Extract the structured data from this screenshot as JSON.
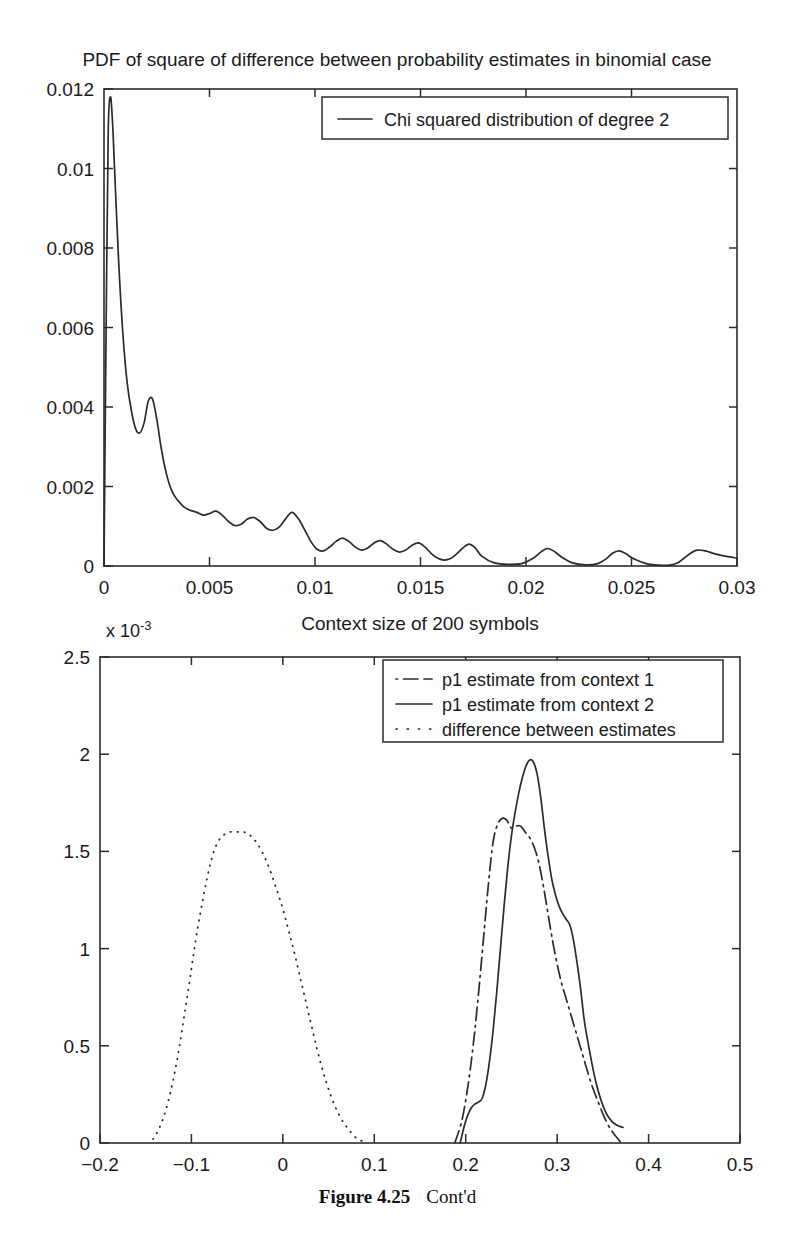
{
  "figure": {
    "caption_label": "Figure  4.25",
    "caption_text": "Cont'd"
  },
  "chart_data": [
    {
      "id": "top",
      "type": "line",
      "title": "PDF of square of difference between probability estimates in binomial case",
      "xlabel": "",
      "ylabel": "",
      "xlim": [
        0,
        0.03
      ],
      "ylim": [
        0,
        0.012
      ],
      "xticks": [
        0,
        0.005,
        0.01,
        0.015,
        0.02,
        0.025,
        0.03
      ],
      "xticklabels": [
        "0",
        "0.005",
        "0.01",
        "0.015",
        "0.02",
        "0.025",
        "0.03"
      ],
      "yticks": [
        0,
        0.002,
        0.004,
        0.006,
        0.008,
        0.01,
        0.012
      ],
      "yticklabels": [
        "0",
        "0.002",
        "0.004",
        "0.006",
        "0.008",
        "0.01",
        "0.012"
      ],
      "grid": false,
      "legend_position": "top-center",
      "legend": [
        "Chi squared distribution of degree 2"
      ],
      "series": [
        {
          "name": "Chi squared distribution of degree 2",
          "style": "solid",
          "x": [
            0.0,
            0.0001,
            0.0002,
            0.0003,
            0.0004,
            0.0005,
            0.0007,
            0.0009,
            0.0011,
            0.0013,
            0.0015,
            0.0017,
            0.0019,
            0.0021,
            0.0023,
            0.0025,
            0.0027,
            0.0029,
            0.0031,
            0.0033,
            0.0035,
            0.0038,
            0.0041,
            0.0044,
            0.0047,
            0.005,
            0.0053,
            0.0056,
            0.0059,
            0.0062,
            0.0065,
            0.0068,
            0.0071,
            0.0074,
            0.0077,
            0.008,
            0.0083,
            0.0086,
            0.0089,
            0.0092,
            0.0095,
            0.0098,
            0.0101,
            0.0104,
            0.0107,
            0.011,
            0.0113,
            0.0116,
            0.0119,
            0.0122,
            0.0125,
            0.0128,
            0.0131,
            0.0134,
            0.0137,
            0.014,
            0.0143,
            0.0146,
            0.0149,
            0.0152,
            0.0155,
            0.0158,
            0.0161,
            0.0164,
            0.0167,
            0.017,
            0.0173,
            0.0176,
            0.0179,
            0.0185,
            0.0192,
            0.0198,
            0.0203,
            0.0207,
            0.021,
            0.0213,
            0.0217,
            0.0222,
            0.0228,
            0.0234,
            0.0238,
            0.0241,
            0.0244,
            0.0247,
            0.0251,
            0.0257,
            0.0263,
            0.0268,
            0.0272,
            0.0275,
            0.0278,
            0.0281,
            0.0285,
            0.029,
            0.0295,
            0.03
          ],
          "y": [
            0.0,
            0.006,
            0.0109,
            0.0118,
            0.0112,
            0.01,
            0.0076,
            0.0058,
            0.0046,
            0.0039,
            0.00345,
            0.00335,
            0.0036,
            0.00415,
            0.0042,
            0.0037,
            0.003,
            0.00245,
            0.00205,
            0.0018,
            0.00165,
            0.00148,
            0.0014,
            0.00135,
            0.00128,
            0.00132,
            0.00138,
            0.00128,
            0.00112,
            0.00102,
            0.00105,
            0.00118,
            0.00122,
            0.00112,
            0.00095,
            0.0009,
            0.00098,
            0.00118,
            0.00135,
            0.0012,
            0.00092,
            0.00062,
            0.00042,
            0.00038,
            0.00048,
            0.00062,
            0.0007,
            0.00062,
            0.00048,
            0.0004,
            0.00045,
            0.00058,
            0.00064,
            0.00055,
            0.00042,
            0.00035,
            0.0004,
            0.00052,
            0.00058,
            0.00048,
            0.00032,
            0.0002,
            0.00015,
            0.00018,
            0.0003,
            0.00045,
            0.00055,
            0.00045,
            0.00025,
            8e-05,
            4e-05,
            6e-05,
            0.00018,
            0.00035,
            0.00044,
            0.00038,
            0.00022,
            8e-05,
            3e-05,
            6e-05,
            0.00018,
            0.00032,
            0.00038,
            0.00032,
            0.00018,
            6e-05,
            2e-05,
            2e-05,
            8e-05,
            0.0002,
            0.00032,
            0.0004,
            0.00038,
            0.0003,
            0.00024,
            0.0002
          ]
        }
      ]
    },
    {
      "id": "bottom",
      "type": "line",
      "title": "Context size of 200 symbols",
      "y_multiplier_base": "x 10",
      "y_multiplier_exp": "-3",
      "xlabel": "",
      "ylabel": "",
      "xlim": [
        -0.2,
        0.5
      ],
      "ylim": [
        0,
        0.0025
      ],
      "xticks": [
        -0.2,
        -0.1,
        0,
        0.1,
        0.2,
        0.3,
        0.4,
        0.5
      ],
      "xticklabels": [
        "-0.2",
        "-0.1",
        "0",
        "0.1",
        "0.2",
        "0.3",
        "0.4",
        "0.5"
      ],
      "yticks": [
        0,
        0.0005,
        0.001,
        0.0015,
        0.002,
        0.0025
      ],
      "yticklabels": [
        "0",
        "0.5",
        "1",
        "1.5",
        "2",
        "2.5"
      ],
      "grid": false,
      "legend_position": "top-center",
      "legend": [
        "p1 estimate from context 1",
        "p1 estimate from context 2",
        "difference between estimates"
      ],
      "series": [
        {
          "name": "p1 estimate from context 1",
          "style": "dashdot",
          "x": [
            0.188,
            0.195,
            0.2,
            0.205,
            0.21,
            0.215,
            0.22,
            0.225,
            0.23,
            0.235,
            0.24,
            0.245,
            0.25,
            0.255,
            0.26,
            0.265,
            0.27,
            0.275,
            0.28,
            0.285,
            0.29,
            0.295,
            0.3,
            0.305,
            0.31,
            0.315,
            0.32,
            0.325,
            0.33,
            0.335,
            0.34,
            0.345,
            0.35,
            0.355,
            0.36,
            0.365,
            0.37
          ],
          "y": [
            0.0,
            0.0001,
            0.00022,
            0.00038,
            0.00058,
            0.00082,
            0.00108,
            0.00134,
            0.00155,
            0.00164,
            0.00167,
            0.00166,
            0.00162,
            0.00163,
            0.00163,
            0.0016,
            0.00157,
            0.00152,
            0.00144,
            0.00132,
            0.00118,
            0.00104,
            0.00092,
            0.00082,
            0.00074,
            0.00066,
            0.00058,
            0.0005,
            0.00042,
            0.00034,
            0.00027,
            0.00021,
            0.00015,
            0.0001,
            6e-05,
            3e-05,
            0.0
          ]
        },
        {
          "name": "p1 estimate from context 2",
          "style": "solid",
          "x": [
            0.194,
            0.198,
            0.202,
            0.206,
            0.21,
            0.214,
            0.218,
            0.222,
            0.226,
            0.23,
            0.234,
            0.238,
            0.242,
            0.246,
            0.25,
            0.254,
            0.258,
            0.262,
            0.266,
            0.27,
            0.274,
            0.278,
            0.282,
            0.286,
            0.29,
            0.294,
            0.298,
            0.302,
            0.306,
            0.31,
            0.314,
            0.318,
            0.322,
            0.326,
            0.33,
            0.336,
            0.342,
            0.348,
            0.354,
            0.36,
            0.366,
            0.372
          ],
          "y": [
            0.0,
            8e-05,
            0.00014,
            0.00018,
            0.0002,
            0.00021,
            0.00023,
            0.0003,
            0.00042,
            0.00058,
            0.00078,
            0.001,
            0.00122,
            0.00142,
            0.00158,
            0.0017,
            0.0018,
            0.00188,
            0.00194,
            0.00197,
            0.00196,
            0.0019,
            0.00178,
            0.00162,
            0.00148,
            0.00136,
            0.00128,
            0.00122,
            0.00118,
            0.00115,
            0.00112,
            0.00104,
            0.00092,
            0.00078,
            0.00062,
            0.00046,
            0.00032,
            0.00022,
            0.00015,
            0.00011,
            9e-05,
            8e-05
          ]
        },
        {
          "name": "difference between estimates",
          "style": "dotted",
          "x": [
            -0.142,
            -0.138,
            -0.133,
            -0.128,
            -0.123,
            -0.118,
            -0.113,
            -0.108,
            -0.103,
            -0.098,
            -0.093,
            -0.088,
            -0.083,
            -0.078,
            -0.073,
            -0.068,
            -0.063,
            -0.058,
            -0.053,
            -0.048,
            -0.043,
            -0.038,
            -0.033,
            -0.028,
            -0.023,
            -0.018,
            -0.013,
            -0.008,
            -0.003,
            0.002,
            0.007,
            0.012,
            0.017,
            0.022,
            0.027,
            0.032,
            0.037,
            0.042,
            0.047,
            0.052,
            0.057,
            0.062,
            0.067,
            0.072,
            0.077,
            0.082,
            0.087
          ],
          "y": [
            2e-05,
            5e-05,
            0.0001,
            0.00017,
            0.00026,
            0.00037,
            0.0005,
            0.00065,
            0.0008,
            0.00096,
            0.00111,
            0.00124,
            0.00136,
            0.00146,
            0.00153,
            0.00157,
            0.00159,
            0.0016,
            0.0016,
            0.0016,
            0.0016,
            0.00159,
            0.00157,
            0.00154,
            0.0015,
            0.00145,
            0.00139,
            0.00132,
            0.00125,
            0.00117,
            0.00108,
            0.00099,
            0.00089,
            0.00079,
            0.00069,
            0.00059,
            0.00049,
            0.0004,
            0.00032,
            0.00025,
            0.00019,
            0.00014,
            0.0001,
            7e-05,
            4e-05,
            2e-05,
            1e-05
          ]
        }
      ]
    }
  ]
}
